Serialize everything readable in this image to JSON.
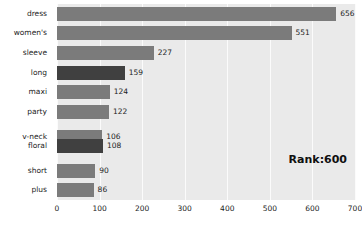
{
  "chart_data": {
    "type": "bar",
    "orientation": "horizontal",
    "title": "",
    "xlabel": "",
    "ylabel": "",
    "xlim": [
      0,
      700
    ],
    "ylim": [
      0,
      10
    ],
    "grid": true,
    "legend": false,
    "categories": [
      "dress",
      "women's",
      "sleeve",
      "long",
      "maxi",
      "party",
      "v-neck",
      "floral",
      "short",
      "plus"
    ],
    "values": [
      656,
      551,
      227,
      159,
      124,
      122,
      106,
      108,
      90,
      86
    ],
    "highlighted": [
      "long",
      "floral"
    ],
    "xticks": [
      0,
      100,
      200,
      300,
      400,
      500,
      600,
      700
    ],
    "xticklabels": [
      "0",
      "100",
      "200",
      "300",
      "400",
      "500",
      "600",
      "700"
    ],
    "annotations": [
      {
        "text": "Rank:600",
        "position": "bottom-right"
      }
    ],
    "colors": {
      "bar": "#7b7b7b",
      "bar_highlight": "#404040",
      "plot_background": "#eaeaea",
      "gridline": "#fbfbfb",
      "text": "#1c1c1c"
    }
  },
  "annotation": {
    "rank_label": "Rank:600"
  }
}
